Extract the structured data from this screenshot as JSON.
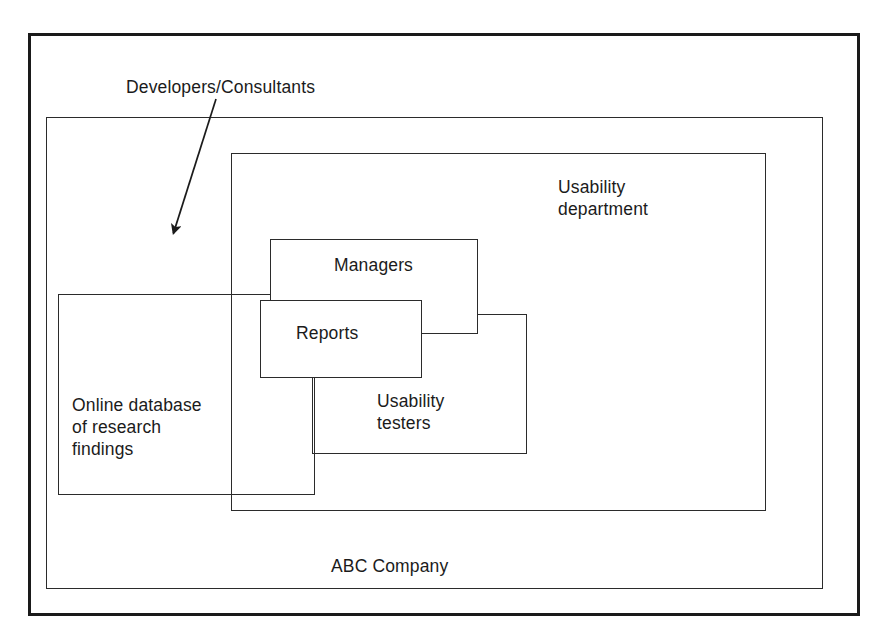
{
  "diagram": {
    "title_note": "Nested containment diagram of an organization",
    "boxes": [
      {
        "id": "abc",
        "label": "ABC Company"
      },
      {
        "id": "usability_dept",
        "label": "Usability\ndepartment"
      },
      {
        "id": "managers",
        "label": "Managers"
      },
      {
        "id": "reports",
        "label": "Reports"
      },
      {
        "id": "usability_testers",
        "label": "Usability\ntesters"
      },
      {
        "id": "online_db",
        "label": "Online database\nof research\nfindings"
      }
    ],
    "annotation": {
      "label": "Developers/Consultants",
      "arrow": {
        "from_x": 216,
        "from_y": 99,
        "to_x": 171,
        "to_y": 241
      }
    },
    "colors": {
      "ink": "#1b1b1b",
      "line": "#2b2b2b",
      "frame": "#1a1a1a",
      "paper": "#ffffff"
    }
  }
}
